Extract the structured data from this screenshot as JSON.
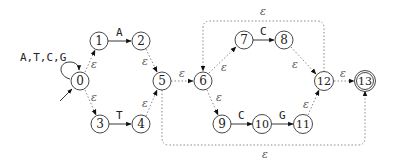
{
  "diagram": {
    "type": "finite-automaton",
    "start_state": "0",
    "accept_state": "13",
    "self_loop_label": "A,T,C,G",
    "states": [
      {
        "id": "0",
        "x": 80,
        "y": 81
      },
      {
        "id": "1",
        "x": 99,
        "y": 41
      },
      {
        "id": "2",
        "x": 141,
        "y": 41
      },
      {
        "id": "3",
        "x": 100,
        "y": 124
      },
      {
        "id": "4",
        "x": 141,
        "y": 124
      },
      {
        "id": "5",
        "x": 162,
        "y": 81
      },
      {
        "id": "6",
        "x": 203,
        "y": 81
      },
      {
        "id": "7",
        "x": 244,
        "y": 40
      },
      {
        "id": "8",
        "x": 284,
        "y": 40
      },
      {
        "id": "9",
        "x": 222,
        "y": 124
      },
      {
        "id": "10",
        "x": 262,
        "y": 124
      },
      {
        "id": "11",
        "x": 303,
        "y": 124
      },
      {
        "id": "12",
        "x": 324,
        "y": 81
      },
      {
        "id": "13",
        "x": 365,
        "y": 81
      }
    ],
    "transitions": [
      {
        "from": "0",
        "to": "0",
        "label": "A,T,C,G"
      },
      {
        "from": "0",
        "to": "1",
        "label": "ε"
      },
      {
        "from": "0",
        "to": "3",
        "label": "ε"
      },
      {
        "from": "1",
        "to": "2",
        "label": "A"
      },
      {
        "from": "3",
        "to": "4",
        "label": "T"
      },
      {
        "from": "2",
        "to": "5",
        "label": "ε"
      },
      {
        "from": "4",
        "to": "5",
        "label": "ε"
      },
      {
        "from": "5",
        "to": "6",
        "label": "ε"
      },
      {
        "from": "6",
        "to": "7",
        "label": "ε"
      },
      {
        "from": "6",
        "to": "9",
        "label": "ε"
      },
      {
        "from": "7",
        "to": "8",
        "label": "C"
      },
      {
        "from": "9",
        "to": "10",
        "label": "C"
      },
      {
        "from": "10",
        "to": "11",
        "label": "G"
      },
      {
        "from": "8",
        "to": "12",
        "label": "ε"
      },
      {
        "from": "11",
        "to": "12",
        "label": "ε"
      },
      {
        "from": "12",
        "to": "13",
        "label": "ε"
      },
      {
        "from": "12",
        "to": "6",
        "label": "ε"
      },
      {
        "from": "5",
        "to": "13",
        "label": "ε"
      }
    ],
    "labels": {
      "loop": "A,T,C,G",
      "a": "A",
      "t": "T",
      "c1": "C",
      "c2": "C",
      "g": "G",
      "eps": "ε"
    },
    "state_labels": {
      "s0": "0",
      "s1": "1",
      "s2": "2",
      "s3": "3",
      "s4": "4",
      "s5": "5",
      "s6": "6",
      "s7": "7",
      "s8": "8",
      "s9": "9",
      "s10": "10",
      "s11": "11",
      "s12": "12",
      "s13": "13"
    }
  }
}
